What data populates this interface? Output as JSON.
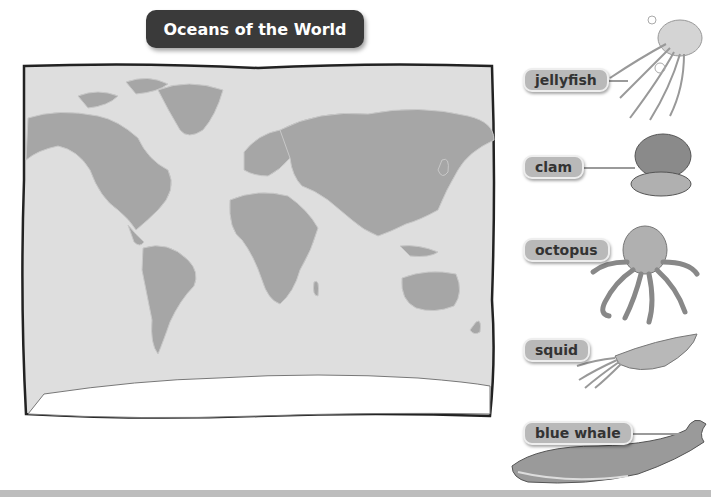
{
  "title": "Oceans of the World",
  "map": {
    "description": "World map with continents in gray on light gray ocean background",
    "colors": {
      "ocean": "#dedede",
      "land": "#a6a6a6",
      "border": "#222222"
    }
  },
  "animals": [
    {
      "label": "jellyfish",
      "icon": "jellyfish-icon"
    },
    {
      "label": "clam",
      "icon": "clam-icon"
    },
    {
      "label": "octopus",
      "icon": "octopus-icon"
    },
    {
      "label": "squid",
      "icon": "squid-icon"
    },
    {
      "label": "blue whale",
      "icon": "blue-whale-icon"
    }
  ]
}
